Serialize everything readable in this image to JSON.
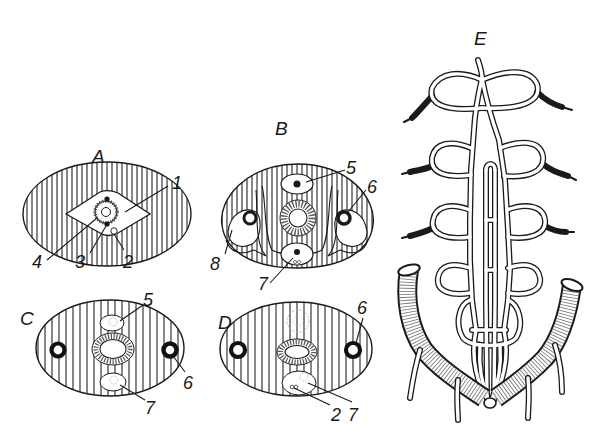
{
  "figure": {
    "panels": [
      {
        "id": "A",
        "label": "A",
        "labels": [
          "1",
          "2",
          "3",
          "4"
        ]
      },
      {
        "id": "B",
        "label": "B",
        "labels": [
          "5",
          "6",
          "7",
          "8"
        ]
      },
      {
        "id": "C",
        "label": "C",
        "labels": [
          "5",
          "6",
          "7"
        ]
      },
      {
        "id": "D",
        "label": "D",
        "labels": [
          "6",
          "2",
          "7"
        ]
      },
      {
        "id": "E",
        "label": "E",
        "labels": []
      }
    ]
  },
  "colors": {
    "ink": "#1a1a1a",
    "background": "#ffffff"
  }
}
